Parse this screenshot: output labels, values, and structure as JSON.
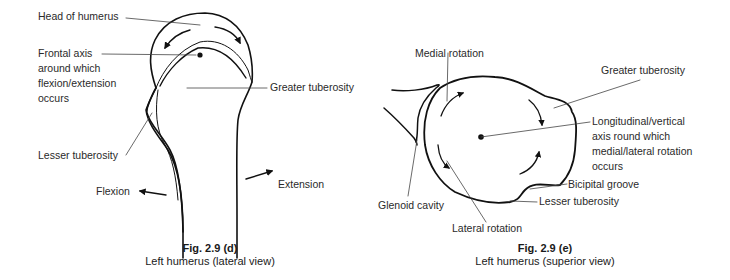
{
  "figures": [
    {
      "id": "fig-2-9-d",
      "caption": {
        "title": "Fig. 2.9 (d)",
        "subtitle": "Left humerus (lateral view)"
      },
      "labels": {
        "head": "Head of humerus",
        "frontal_axis": [
          "Frontal axis",
          "around which",
          "flexion/extension",
          "occurs"
        ],
        "greater_tuberosity": "Greater tuberosity",
        "lesser_tuberosity": "Lesser tuberosity",
        "flexion": "Flexion",
        "extension": "Extension"
      }
    },
    {
      "id": "fig-2-9-e",
      "caption": {
        "title": "Fig. 2.9 (e)",
        "subtitle": "Left humerus (superior view)"
      },
      "labels": {
        "medial_rotation": "Medial rotation",
        "greater_tuberosity": "Greater tuberosity",
        "longitudinal_axis": [
          "Longitudinal/vertical",
          "axis round which",
          "medial/lateral rotation",
          "occurs"
        ],
        "bicipital_groove": "Bicipital groove",
        "lesser_tuberosity": "Lesser tuberosity",
        "glenoid_cavity": "Glenoid cavity",
        "lateral_rotation": "Lateral rotation"
      }
    }
  ]
}
